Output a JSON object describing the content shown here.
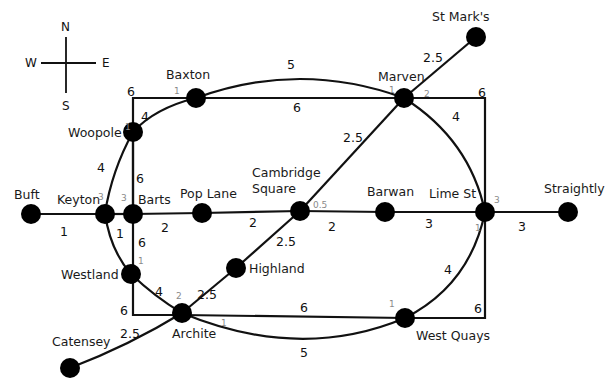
{
  "compass": {
    "n": "N",
    "s": "S",
    "e": "E",
    "w": "W"
  },
  "nodes": [
    {
      "id": "buft",
      "label": "Buft",
      "degree": ""
    },
    {
      "id": "keyton",
      "label": "Keyton",
      "degree": "3"
    },
    {
      "id": "barts",
      "label": "Barts",
      "degree": "3"
    },
    {
      "id": "pop_lane",
      "label": "Pop Lane",
      "degree": ""
    },
    {
      "id": "cambridge_square",
      "label_line1": "Cambridge",
      "label_line2": "Square",
      "degree": "0.5"
    },
    {
      "id": "barwan",
      "label": "Barwan",
      "degree": ""
    },
    {
      "id": "lime_st",
      "label": "Lime St",
      "degree_top": "3",
      "degree_bottom": "1"
    },
    {
      "id": "straightly",
      "label": "Straightly",
      "degree": ""
    },
    {
      "id": "baxton",
      "label": "Baxton",
      "degree": "1"
    },
    {
      "id": "marven",
      "label": "Marven",
      "degree_left": "1",
      "degree_right": "2"
    },
    {
      "id": "st_marks",
      "label": "St Mark's",
      "degree": ""
    },
    {
      "id": "woopole",
      "label": "Woopole",
      "degree": "1"
    },
    {
      "id": "westland",
      "label": "Westland",
      "degree": "1"
    },
    {
      "id": "archite",
      "label": "Archite",
      "degree_top": "2",
      "degree_right": "1"
    },
    {
      "id": "highland",
      "label": "Highland",
      "degree": ""
    },
    {
      "id": "catensey",
      "label": "Catensey",
      "degree": ""
    },
    {
      "id": "west_quays",
      "label": "West Quays",
      "degree": "1"
    }
  ],
  "edges": [
    {
      "from": "buft",
      "to": "keyton",
      "weight": "1"
    },
    {
      "from": "keyton",
      "to": "barts",
      "weight": "1"
    },
    {
      "from": "barts",
      "to": "pop_lane",
      "weight": "2"
    },
    {
      "from": "pop_lane",
      "to": "cambridge_square",
      "weight": "2"
    },
    {
      "from": "cambridge_square",
      "to": "barwan",
      "weight": "2"
    },
    {
      "from": "barwan",
      "to": "lime_st",
      "weight": "3"
    },
    {
      "from": "lime_st",
      "to": "straightly",
      "weight": "3"
    },
    {
      "from": "baxton",
      "to": "marven",
      "weight": "5",
      "style": "curve"
    },
    {
      "from": "baxton",
      "to": "marven",
      "weight": "6",
      "style": "straight"
    },
    {
      "from": "marven",
      "to": "st_marks",
      "weight": "2.5"
    },
    {
      "from": "cambridge_square",
      "to": "marven",
      "weight": "2.5"
    },
    {
      "from": "cambridge_square",
      "to": "highland",
      "weight": "2.5"
    },
    {
      "from": "highland",
      "to": "archite",
      "weight": "2.5"
    },
    {
      "from": "archite",
      "to": "catensey",
      "weight": "2.5"
    },
    {
      "from": "woopole",
      "to": "baxton",
      "weight": "4"
    },
    {
      "from": "woopole",
      "to": "keyton",
      "weight": "4"
    },
    {
      "from": "woopole",
      "to": "barts",
      "weight": "6"
    },
    {
      "from": "barts",
      "to": "westland",
      "weight": "6"
    },
    {
      "from": "westland",
      "to": "archite",
      "weight": "4"
    },
    {
      "from": "archite",
      "to": "west_quays",
      "weight": "6",
      "style": "straight"
    },
    {
      "from": "archite",
      "to": "west_quays",
      "weight": "5",
      "style": "curve"
    },
    {
      "from": "marven",
      "to": "lime_st",
      "weight": "4"
    },
    {
      "from": "lime_st",
      "to": "west_quays",
      "weight": "4"
    },
    {
      "from": "corner_tl",
      "to": "baxton",
      "weight": "6"
    },
    {
      "from": "marven",
      "to": "corner_tr",
      "weight": "6"
    },
    {
      "from": "corner_br",
      "to": "west_quays",
      "weight": "6"
    },
    {
      "from": "archite",
      "to": "corner_bl",
      "weight": "6"
    }
  ],
  "weights": {
    "buft_keyton": "1",
    "keyton_barts": "1",
    "barts_pop": "2",
    "pop_cam": "2",
    "cam_barwan": "2",
    "barwan_lime": "3",
    "lime_straightly": "3",
    "baxton_marven_curve": "5",
    "baxton_marven_straight": "6",
    "marven_stmarks": "2.5",
    "cam_marven": "2.5",
    "cam_highland": "2.5",
    "highland_archite": "2.5",
    "archite_catensey": "2.5",
    "woopole_baxton": "4",
    "woopole_keyton": "4",
    "woopole_barts": "6",
    "barts_westland": "6",
    "westland_archite": "4",
    "archite_westquays_straight": "6",
    "archite_westquays_curve": "5",
    "marven_lime": "4",
    "lime_westquays": "4",
    "corner_tl": "6",
    "corner_tr": "6",
    "corner_br": "6",
    "corner_bl": "6"
  }
}
